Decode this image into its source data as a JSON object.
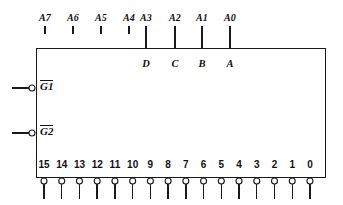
{
  "diagram": {
    "type": "logic-symbol",
    "line_color": "#1a1a1a",
    "fill_color": "#ffffff",
    "body": {
      "x": 36,
      "y": 48,
      "width": 289,
      "height": 129
    },
    "address_bus": {
      "labels": [
        "A7",
        "A6",
        "A5",
        "A4",
        "A3",
        "A2",
        "A1",
        "A0"
      ],
      "x_positions": [
        45,
        73,
        101,
        129,
        146,
        175,
        202,
        230
      ],
      "label_y": 18,
      "stub_top_y": 26,
      "stub_short_bottom_y": 34,
      "connected_indices": [
        4,
        5,
        6,
        7
      ]
    },
    "data_inputs": {
      "labels": [
        "D",
        "C",
        "B",
        "A"
      ],
      "x_positions": [
        146,
        175,
        202,
        230
      ],
      "y": 66
    },
    "enable_inputs": [
      {
        "label": "G1",
        "overbar": true,
        "y": 88,
        "bubble_cx": 32,
        "lead_x": 12
      },
      {
        "label": "G2",
        "overbar": true,
        "y": 133,
        "bubble_cx": 32,
        "lead_x": 12
      }
    ],
    "outputs": {
      "labels": [
        "15",
        "14",
        "13",
        "12",
        "11",
        "10",
        "9",
        "8",
        "7",
        "6",
        "5",
        "4",
        "3",
        "2",
        "1",
        "0"
      ],
      "label_y": 168,
      "first_x": 44,
      "spacing": 17.73,
      "bubble_cy": 181,
      "bubble_r": 3,
      "stem_bottom_y": 199
    }
  }
}
